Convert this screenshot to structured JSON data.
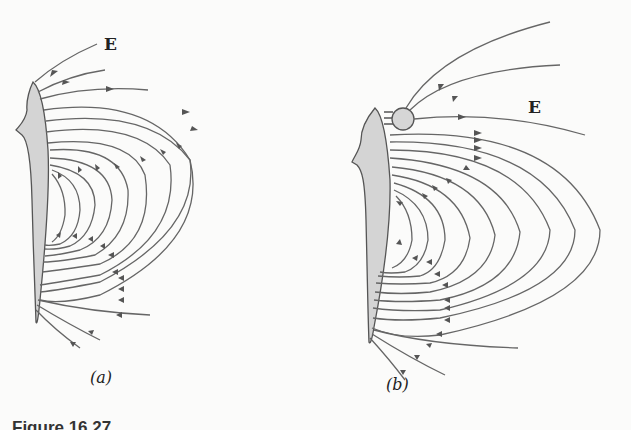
{
  "figure": {
    "panels": [
      {
        "id": "a",
        "label": "(a)",
        "field_label": "E",
        "description": "Electric field lines around a fish"
      },
      {
        "id": "b",
        "label": "(b)",
        "field_label": "E",
        "description": "Electric field lines around a fish with a conducting sphere nearby"
      }
    ],
    "caption": "Figure 16.27",
    "colors": {
      "line": "#555555",
      "body_fill": "#d4d4d4",
      "sphere_fill": "#d6d6d6"
    }
  }
}
